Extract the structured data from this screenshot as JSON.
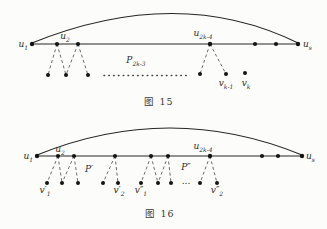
{
  "colors": {
    "background": "#fcfcfa",
    "line": "#262626",
    "dashed_edge": "#5a5a5a",
    "text": "#2d2d2d"
  },
  "figure15": {
    "caption": "图 15",
    "vertex_labels": {
      "u1": {
        "base": "u",
        "sub": "1"
      },
      "u2": {
        "base": "u",
        "sub": "2"
      },
      "u2k4": {
        "base": "u",
        "sub": "2k-4"
      },
      "us": {
        "base": "u",
        "sub": "s"
      },
      "vk1": {
        "base": "v",
        "sub": "k-1"
      },
      "vk": {
        "base": "v",
        "sub": "k"
      }
    },
    "path_label": {
      "base": "P",
      "sub": "2k-3"
    }
  },
  "figure16": {
    "caption": "图 16",
    "vertex_labels": {
      "u1": {
        "base": "u",
        "sub": "1"
      },
      "u2": {
        "base": "u",
        "sub": "2"
      },
      "u2k4": {
        "base": "u",
        "sub": "2k-4"
      },
      "us": {
        "base": "u",
        "sub": "s"
      },
      "v1p": {
        "base": "v′",
        "sub": "1"
      },
      "v2p": {
        "base": "v′",
        "sub": "2"
      },
      "v1pp": {
        "base": "v″",
        "sub": "1"
      },
      "v2pp": {
        "base": "v″",
        "sub": "2"
      }
    },
    "path_labels": {
      "p_prime": "P′",
      "p_dprime": "P″"
    },
    "ellipsis": "..."
  }
}
